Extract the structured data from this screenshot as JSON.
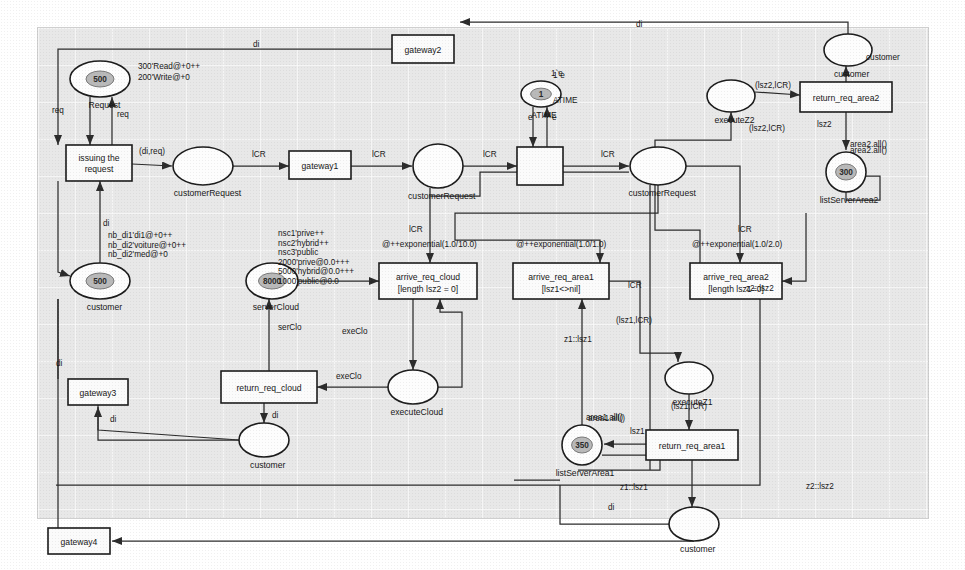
{
  "diagram": {
    "canvas": {
      "x": 38,
      "y": 28,
      "w": 890,
      "h": 490
    }
  },
  "places": [
    {
      "id": "p_request",
      "name": "Request",
      "marking": "500",
      "inscription": [
        "300'Read@+0++",
        "200'Write@+0"
      ],
      "cx": 100,
      "cy": 79,
      "rx": 30,
      "ry": 18,
      "shape": "ellipse"
    },
    {
      "id": "p_customerRequest1",
      "name": "customerRequest",
      "marking": "",
      "inscription": [],
      "cx": 203,
      "cy": 166,
      "rx": 30,
      "ry": 19,
      "shape": "ellipse"
    },
    {
      "id": "p_customerRequest2",
      "name": "customerRequest",
      "marking": "",
      "inscription": [],
      "cx": 438,
      "cy": 166,
      "rx": 25,
      "ry": 22,
      "shape": "ellipse"
    },
    {
      "id": "p_customerRequest3",
      "name": "customerRequest",
      "marking": "",
      "inscription": [],
      "cx": 658,
      "cy": 166,
      "rx": 28,
      "ry": 19,
      "shape": "ellipse"
    },
    {
      "id": "p_customer_left",
      "name": "customer",
      "marking": "500",
      "inscription": [
        "nb_di1'di1@+0++",
        "nb_di2'voiture@+0++",
        "nb_di2'med@+0"
      ],
      "cx": 100,
      "cy": 281,
      "rx": 30,
      "ry": 18,
      "shape": "ellipse"
    },
    {
      "id": "p_serverCloud",
      "name": "serverCloud",
      "marking": "8000",
      "inscription": [
        "nsc1'prive++",
        "nsc2'hybrid++",
        "nsc3'public",
        "2000'prive@0.0+++",
        "5000'hybrid@0.0+++",
        "1000'public@0.0"
      ],
      "cx": 272,
      "cy": 281,
      "rx": 26,
      "ry": 18,
      "shape": "ellipse"
    },
    {
      "id": "p_executeCloud",
      "name": "executeCloud",
      "marking": "",
      "inscription": [],
      "cx": 413,
      "cy": 387,
      "rx": 25,
      "ry": 17,
      "shape": "ellipse"
    },
    {
      "id": "p_customer_bl",
      "name": "customer",
      "marking": "",
      "inscription": [],
      "cx": 264,
      "cy": 440,
      "rx": 25,
      "ry": 17,
      "shape": "ellipse"
    },
    {
      "id": "p_ATIME",
      "name": "ATIME",
      "marking": "1",
      "inscription": [
        "1`e"
      ],
      "cx": 541,
      "cy": 94,
      "rx": 20,
      "ry": 13,
      "shape": "ellipse"
    },
    {
      "id": "p_customer_tr",
      "name": "customer",
      "marking": "",
      "inscription": [],
      "cx": 848,
      "cy": 50,
      "rx": 24,
      "ry": 16,
      "shape": "ellipse"
    },
    {
      "id": "p_executeZ2",
      "name": "executeZ2",
      "marking": "",
      "inscription": [],
      "cx": 731,
      "cy": 96,
      "rx": 24,
      "ry": 16,
      "shape": "ellipse"
    },
    {
      "id": "p_listServerArea2",
      "name": "listServerArea2",
      "marking": "300",
      "inscription": [
        "area2.all()"
      ],
      "cx": 846,
      "cy": 172,
      "rx": 20,
      "ry": 20,
      "shape": "ellipse"
    },
    {
      "id": "p_executeZ1",
      "name": "executeZ1",
      "marking": "",
      "inscription": [],
      "cx": 689,
      "cy": 378,
      "rx": 24,
      "ry": 16,
      "shape": "ellipse"
    },
    {
      "id": "p_listServerArea1",
      "name": "listServerArea1",
      "marking": "350",
      "inscription": [
        "area1.all()"
      ],
      "cx": 582,
      "cy": 445,
      "rx": 20,
      "ry": 20,
      "shape": "ellipse"
    },
    {
      "id": "p_customer_br",
      "name": "customer",
      "marking": "",
      "inscription": [],
      "cx": 694,
      "cy": 524,
      "rx": 25,
      "ry": 17,
      "shape": "ellipse"
    }
  ],
  "transitions": [
    {
      "id": "t_issuing",
      "name": "issuing the request",
      "guard": "",
      "x": 66,
      "y": 145,
      "w": 66,
      "h": 36
    },
    {
      "id": "t_gateway1",
      "name": "gateway1",
      "guard": "",
      "x": 289,
      "y": 151,
      "w": 62,
      "h": 28
    },
    {
      "id": "t_gateway2",
      "name": "gateway2",
      "guard": "",
      "x": 392,
      "y": 35,
      "w": 62,
      "h": 28
    },
    {
      "id": "t_gateway3",
      "name": "gateway3",
      "guard": "",
      "x": 68,
      "y": 379,
      "w": 60,
      "h": 26
    },
    {
      "id": "t_gateway4",
      "name": "gateway4",
      "guard": "",
      "x": 48,
      "y": 528,
      "w": 62,
      "h": 26
    },
    {
      "id": "t_clock",
      "name": "",
      "guard": "",
      "x": 517,
      "y": 147,
      "w": 46,
      "h": 38
    },
    {
      "id": "t_arrive_req_cloud",
      "name": "arrive_req_cloud",
      "guard": "[length lsz2 = 0]",
      "x": 379,
      "y": 263,
      "w": 98,
      "h": 36
    },
    {
      "id": "t_arrive_req_area1",
      "name": "arrive_req_area1",
      "guard": "[lsz1<>nil]",
      "x": 513,
      "y": 263,
      "w": 96,
      "h": 36
    },
    {
      "id": "t_arrive_req_area2",
      "name": "arrive_req_area2",
      "guard": "[length lsz1=0]",
      "x": 690,
      "y": 263,
      "w": 92,
      "h": 36
    },
    {
      "id": "t_return_req_cloud",
      "name": "return_req_cloud",
      "guard": "",
      "x": 221,
      "y": 371,
      "w": 96,
      "h": 32
    },
    {
      "id": "t_return_req_area1",
      "name": "return_req_area1",
      "guard": "",
      "x": 646,
      "y": 430,
      "w": 92,
      "h": 30
    },
    {
      "id": "t_return_req_area2",
      "name": "return_req_area2",
      "guard": "",
      "x": 800,
      "y": 82,
      "w": 92,
      "h": 30
    }
  ],
  "arc_labels": [
    {
      "id": "a1",
      "text": "req",
      "x": 52,
      "y": 113
    },
    {
      "id": "a2",
      "text": "req",
      "x": 117,
      "y": 117
    },
    {
      "id": "a3",
      "text": "(di,req)",
      "x": 139,
      "y": 154
    },
    {
      "id": "a4",
      "text": "lCR",
      "x": 252,
      "y": 157
    },
    {
      "id": "a5",
      "text": "lCR",
      "x": 372,
      "y": 157
    },
    {
      "id": "a6",
      "text": "lCR",
      "x": 483,
      "y": 157
    },
    {
      "id": "a7",
      "text": "lCR",
      "x": 601,
      "y": 157
    },
    {
      "id": "a8",
      "text": "lCR",
      "x": 409,
      "y": 232
    },
    {
      "id": "a9",
      "text": "lCR",
      "x": 628,
      "y": 288
    },
    {
      "id": "a10",
      "text": "lCR",
      "x": 738,
      "y": 232
    },
    {
      "id": "a11",
      "text": "di",
      "x": 103,
      "y": 226
    },
    {
      "id": "a12",
      "text": "di",
      "x": 56,
      "y": 366
    },
    {
      "id": "a13",
      "text": "di",
      "x": 110,
      "y": 422
    },
    {
      "id": "a14",
      "text": "di",
      "x": 272,
      "y": 418
    },
    {
      "id": "a15",
      "text": "di",
      "x": 636,
      "y": 27
    },
    {
      "id": "a16",
      "text": "di",
      "x": 253,
      "y": 47
    },
    {
      "id": "a17",
      "text": "di",
      "x": 608,
      "y": 510
    },
    {
      "id": "a18",
      "text": "serClo",
      "x": 278,
      "y": 330
    },
    {
      "id": "a19",
      "text": "exeClo",
      "x": 342,
      "y": 334
    },
    {
      "id": "a20",
      "text": "exeClo",
      "x": 336,
      "y": 379
    },
    {
      "id": "a21",
      "text": "@++exponential(1.0/10.0)",
      "x": 382,
      "y": 247
    },
    {
      "id": "a22",
      "text": "@++exponential(1.0/1.0)",
      "x": 516,
      "y": 247
    },
    {
      "id": "a23",
      "text": "@++exponential(1.0/2.0)",
      "x": 692,
      "y": 247
    },
    {
      "id": "a24",
      "text": "z1::lsz1",
      "x": 564,
      "y": 342
    },
    {
      "id": "a25",
      "text": "z2::lsz2",
      "x": 746,
      "y": 291
    },
    {
      "id": "a26",
      "text": "(lsz1,lCR)",
      "x": 616,
      "y": 323
    },
    {
      "id": "a27",
      "text": "(lsz1,lCR)",
      "x": 671,
      "y": 409
    },
    {
      "id": "a28",
      "text": "(lsz2,lCR)",
      "x": 749,
      "y": 131
    },
    {
      "id": "a29",
      "text": "(lsz2,lCR)",
      "x": 755,
      "y": 88
    },
    {
      "id": "a30",
      "text": "lsz1",
      "x": 630,
      "y": 434
    },
    {
      "id": "a31",
      "text": "lsz2",
      "x": 817,
      "y": 127
    },
    {
      "id": "a32",
      "text": "z1::lsz1",
      "x": 620,
      "y": 490
    },
    {
      "id": "a33",
      "text": "z2::lsz2",
      "x": 806,
      "y": 489
    },
    {
      "id": "a34",
      "text": "1`e",
      "x": 551,
      "y": 76
    },
    {
      "id": "a35",
      "text": "e",
      "x": 528,
      "y": 120
    },
    {
      "id": "a36",
      "text": "e",
      "x": 552,
      "y": 120
    },
    {
      "id": "a37",
      "text": "ATIME",
      "x": 553,
      "y": 103
    },
    {
      "id": "a38",
      "text": "customer",
      "x": 866,
      "y": 60
    },
    {
      "id": "a39",
      "text": "area2.all()",
      "x": 850,
      "y": 153
    },
    {
      "id": "a40",
      "text": "area1.all()",
      "x": 588,
      "y": 421
    }
  ],
  "colors": {
    "canvas_bg": "#e8e8e8",
    "stroke": "#1b1b1b",
    "arc": "#2b2b2b",
    "token_fill": "#b9b9b9"
  }
}
